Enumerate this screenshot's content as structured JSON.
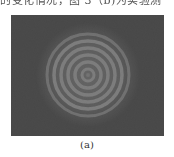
{
  "header_text": "的变化情况，图 3（b)为实验测",
  "figure": {
    "ring_count": 6,
    "background_color": "#2b2b2b",
    "ring_color": "#7a7a7a"
  },
  "caption": "(a)"
}
